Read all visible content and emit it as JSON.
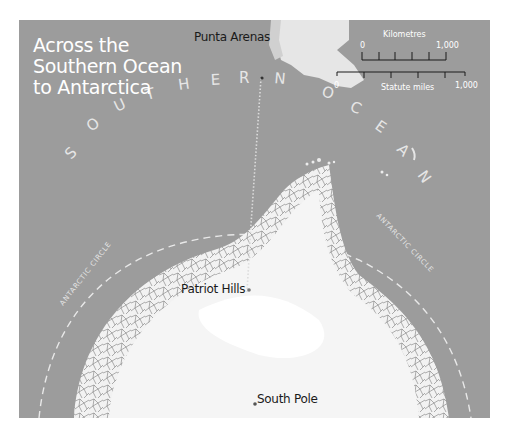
{
  "map": {
    "title_lines": [
      "Across the",
      "Southern Ocean",
      "to Antarctica"
    ],
    "places": {
      "punta_arenas": "Punta Arenas",
      "patriot_hills": "Patriot Hills",
      "south_pole": "South Pole"
    },
    "ocean_label": "SOUTHERN OCEAN",
    "ocean_letters": [
      "S",
      "O",
      "U",
      "T",
      "H",
      "E",
      "R",
      "N",
      "O",
      "C",
      "E",
      "A",
      "N"
    ],
    "circle_label": "ANTARCTIC CIRCLE",
    "scale": {
      "km_label": "Kilometres",
      "km_start": "0",
      "km_end": "1,000",
      "mi_label": "Statute miles",
      "mi_start": "0",
      "mi_end": "1,000"
    },
    "colors": {
      "sea": "#9c9c9c",
      "land": "#f4f4f4",
      "ice_edge": "#6e6e6e",
      "text_light": "#ffffff",
      "text_dark": "#1a1a1a"
    }
  }
}
